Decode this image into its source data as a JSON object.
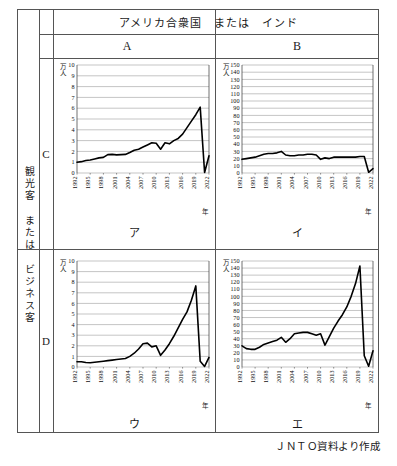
{
  "table": {
    "header_top": "アメリカ合衆国　または　インド",
    "col_A": "A",
    "col_B": "B",
    "side_label": "観光客 または ビジネス客",
    "row_C": "C",
    "row_D": "D"
  },
  "source_note": "ＪＮＴＯ資料より作成",
  "labels": {
    "unit_small": "万\n人",
    "unit_line1": "万",
    "unit_line2": "人",
    "year_axis": "年",
    "name_AC": "ア",
    "name_BC": "イ",
    "name_AD": "ウ",
    "name_BD": "エ"
  },
  "chart_data": [
    {
      "id": "AC",
      "name": "ア",
      "type": "line",
      "title": "ア",
      "xlabel": "年",
      "ylabel": "万人",
      "ylim": [
        0,
        10
      ],
      "yticks": [
        0,
        1,
        2,
        3,
        4,
        5,
        6,
        7,
        8,
        9,
        10
      ],
      "xlim": [
        1992,
        2022
      ],
      "xticks": [
        1992,
        1995,
        1998,
        2001,
        2004,
        2007,
        2010,
        2013,
        2016,
        2019,
        2022
      ],
      "grid": true,
      "legend": "none",
      "x": [
        1992,
        1993,
        1994,
        1995,
        1996,
        1997,
        1998,
        1999,
        2000,
        2001,
        2002,
        2003,
        2004,
        2005,
        2006,
        2007,
        2008,
        2009,
        2010,
        2011,
        2012,
        2013,
        2014,
        2015,
        2016,
        2017,
        2018,
        2019,
        2020,
        2021,
        2022
      ],
      "values": [
        1.0,
        1.05,
        1.15,
        1.2,
        1.3,
        1.4,
        1.45,
        1.7,
        1.72,
        1.68,
        1.7,
        1.72,
        1.9,
        2.1,
        2.2,
        2.4,
        2.6,
        2.8,
        2.75,
        2.2,
        2.8,
        2.7,
        3.0,
        3.2,
        3.6,
        4.2,
        4.8,
        5.4,
        6.1,
        0.05,
        1.6
      ],
      "series_note": "peak 6.1 at 2019, drop to near 0 in 2021, recovery 1.6 in 2022"
    },
    {
      "id": "BC",
      "name": "イ",
      "type": "line",
      "title": "イ",
      "xlabel": "年",
      "ylabel": "万人",
      "ylim": [
        0,
        150
      ],
      "yticks": [
        0,
        10,
        20,
        30,
        40,
        50,
        60,
        70,
        80,
        90,
        100,
        110,
        120,
        130,
        140,
        150
      ],
      "xlim": [
        1992,
        2022
      ],
      "xticks": [
        1992,
        1995,
        1998,
        2001,
        2004,
        2007,
        2010,
        2013,
        2016,
        2019,
        2022
      ],
      "grid": true,
      "legend": "none",
      "x": [
        1992,
        1993,
        1994,
        1995,
        1996,
        1997,
        1998,
        1999,
        2000,
        2001,
        2002,
        2003,
        2004,
        2005,
        2006,
        2007,
        2008,
        2009,
        2010,
        2011,
        2012,
        2013,
        2014,
        2015,
        2016,
        2017,
        2018,
        2019,
        2020,
        2021,
        2022
      ],
      "values": [
        19,
        20,
        21,
        22,
        24,
        26,
        27,
        27,
        28,
        30,
        25,
        24,
        24,
        25,
        25,
        26,
        26,
        25,
        19,
        21,
        20,
        22,
        22,
        22,
        22,
        22,
        22,
        23,
        23,
        1,
        6
      ],
      "series_note": "plateau around 20-30, collapse in 2020-2021, slight recovery 2022"
    },
    {
      "id": "AD",
      "name": "ウ",
      "type": "line",
      "title": "ウ",
      "xlabel": "年",
      "ylabel": "万人",
      "ylim": [
        0,
        10
      ],
      "yticks": [
        0,
        1,
        2,
        3,
        4,
        5,
        6,
        7,
        8,
        9,
        10
      ],
      "xlim": [
        1992,
        2022
      ],
      "xticks": [
        1992,
        1995,
        1998,
        2001,
        2004,
        2007,
        2010,
        2013,
        2016,
        2019,
        2022
      ],
      "grid": true,
      "legend": "none",
      "x": [
        1992,
        1993,
        1994,
        1995,
        1996,
        1997,
        1998,
        1999,
        2000,
        2001,
        2002,
        2003,
        2004,
        2005,
        2006,
        2007,
        2008,
        2009,
        2010,
        2011,
        2012,
        2013,
        2014,
        2015,
        2016,
        2017,
        2018,
        2019,
        2020,
        2021,
        2022
      ],
      "values": [
        0.5,
        0.5,
        0.42,
        0.4,
        0.45,
        0.5,
        0.55,
        0.6,
        0.65,
        0.7,
        0.75,
        0.8,
        1.0,
        1.3,
        1.7,
        2.2,
        2.25,
        1.9,
        2.0,
        1.1,
        1.6,
        2.2,
        2.9,
        3.7,
        4.5,
        5.2,
        6.3,
        7.65,
        0.55,
        0.05,
        0.9
      ],
      "series_note": "rise to 7.65 peak at 2019, collapse, small recovery 0.9 in 2022"
    },
    {
      "id": "BD",
      "name": "エ",
      "type": "line",
      "title": "エ",
      "xlabel": "年",
      "ylabel": "万人",
      "ylim": [
        0,
        150
      ],
      "yticks": [
        0,
        10,
        20,
        30,
        40,
        50,
        60,
        70,
        80,
        90,
        100,
        110,
        120,
        130,
        140,
        150
      ],
      "xlim": [
        1992,
        2022
      ],
      "xticks": [
        1992,
        1995,
        1998,
        2001,
        2004,
        2007,
        2010,
        2013,
        2016,
        2019,
        2022
      ],
      "grid": true,
      "legend": "none",
      "x": [
        1992,
        1993,
        1994,
        1995,
        1996,
        1997,
        1998,
        1999,
        2000,
        2001,
        2002,
        2003,
        2004,
        2005,
        2006,
        2007,
        2008,
        2009,
        2010,
        2011,
        2012,
        2013,
        2014,
        2015,
        2016,
        2017,
        2018,
        2019,
        2020,
        2021,
        2022
      ],
      "values": [
        30,
        26,
        25,
        25,
        28,
        32,
        34,
        36,
        38,
        42,
        35,
        40,
        47,
        48,
        49,
        49,
        47,
        45,
        47,
        31,
        43,
        55,
        65,
        74,
        85,
        100,
        118,
        143,
        16,
        1,
        23
      ],
      "series_note": "peak 143 at 2019, collapse to 1 in 2021, recovery 23 in 2022"
    }
  ]
}
